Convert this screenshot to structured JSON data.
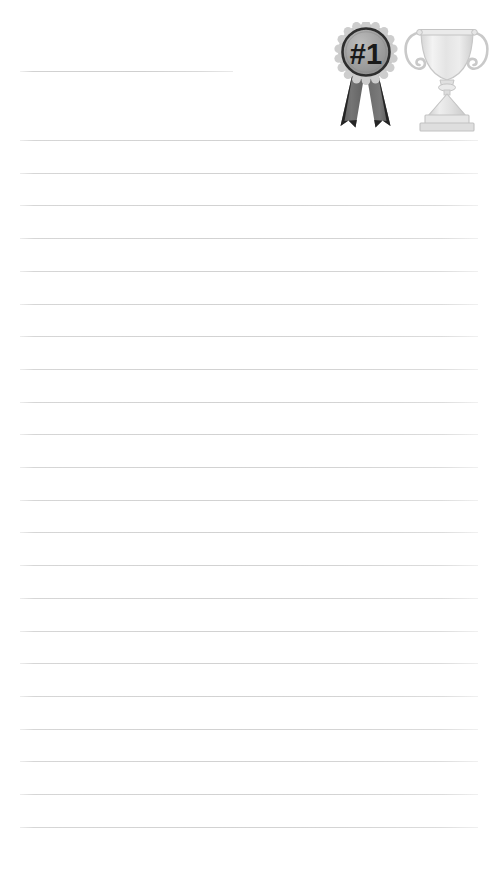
{
  "page": {
    "kind": "lined-notepaper",
    "width_px": 499,
    "height_px": 871,
    "background_color": "#ffffff",
    "title_text": "",
    "body_text": ""
  },
  "rules": {
    "count": 22,
    "first_y": 140,
    "spacing": 32.7,
    "left_x": 20,
    "right_x": 478,
    "color": "#d2d2d2",
    "thickness": 1
  },
  "title_rule": {
    "left_x": 20,
    "y": 71,
    "width": 213,
    "color": "#cfcfcf"
  },
  "artwork": {
    "label": "award-graphics",
    "items": [
      {
        "name": "first-place-ribbon",
        "badge_text": "#1",
        "rosette_color": "#c9c9c9",
        "disc_color": "#9e9e9e",
        "disc_border_color": "#2b2b2b",
        "text_color": "#1c1c1c",
        "ribbon_color": "#6e6e6e",
        "ribbon_tip_color": "#1e1e1e"
      },
      {
        "name": "trophy-cup",
        "body_color": "#e2e2e2",
        "shade_color": "#cfcfcf",
        "highlight_color": "#f6f6f6",
        "outline_color": "#c6c6c6"
      }
    ]
  }
}
